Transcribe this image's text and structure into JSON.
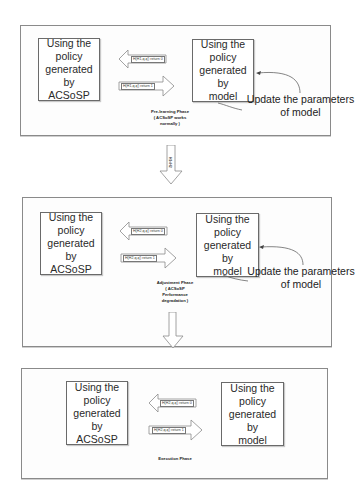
{
  "panels": [
    {
      "left_box": {
        "lines": [
          "Using the",
          "policy",
          "generated by",
          "ACSoSP"
        ]
      },
      "right_box": {
        "lines": [
          "Using the",
          "policy",
          "generated by",
          "model"
        ]
      },
      "arrow_left_label": "H(H1,q,q') return 0",
      "arrow_right_label": "H(H1,q,q') return 1",
      "phase_lines": [
        "Pre-learning Phase",
        "( ACSoSP works",
        "normally )"
      ],
      "update_lines": [
        "Update the parameters",
        "of model"
      ]
    },
    {
      "left_box": {
        "lines": [
          "Using the",
          "policy",
          "generated by",
          "ACSoSP"
        ]
      },
      "right_box": {
        "lines": [
          "Using the",
          "policy",
          "generated by",
          "model"
        ]
      },
      "arrow_left_label": "H(H2,q,q') return 0",
      "arrow_right_label": "H(H2,q,q') return 1",
      "phase_lines": [
        "Adjustment Phase",
        "( ACSoSP",
        "Performance",
        "degradation )"
      ],
      "update_lines": [
        "Update the parameters",
        "of model"
      ]
    },
    {
      "left_box": {
        "lines": [
          "Using the",
          "policy",
          "generated by",
          "ACSoSP"
        ]
      },
      "right_box": {
        "lines": [
          "Using the",
          "policy",
          "generated by",
          "model"
        ]
      },
      "arrow_left_label": "H(H2,q,q') return 0",
      "arrow_right_label": "H(H2,q,q') return 1",
      "phase_lines": [
        "Execution Phase"
      ]
    }
  ],
  "transitions": [
    {
      "label": "H1<H2"
    },
    {
      "label": ""
    }
  ]
}
